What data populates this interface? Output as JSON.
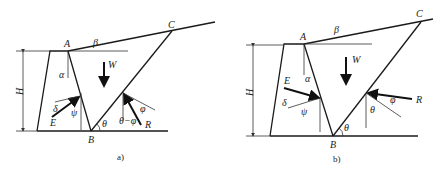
{
  "figures": [
    {
      "id": "a",
      "caption": "a)",
      "labels": {
        "A": "A",
        "B": "B",
        "C": "C",
        "H": "H",
        "W": "W",
        "alpha": "α",
        "beta": "β",
        "delta": "δ",
        "psi": "ψ",
        "E": "E",
        "theta": "θ",
        "theta_minus_phi": "θ−φ",
        "phi": "φ",
        "R": "R"
      }
    },
    {
      "id": "b",
      "caption": "b)",
      "labels": {
        "A": "A",
        "B": "B",
        "C": "C",
        "H": "H",
        "W": "W",
        "alpha": "α",
        "beta": "β",
        "delta": "δ",
        "psi": "ψ",
        "E": "E",
        "theta": "θ",
        "theta_R": "θ",
        "phi": "φ",
        "R": "R"
      }
    }
  ],
  "colors": {
    "line": "#1a1a1a",
    "background": "#ffffff"
  }
}
